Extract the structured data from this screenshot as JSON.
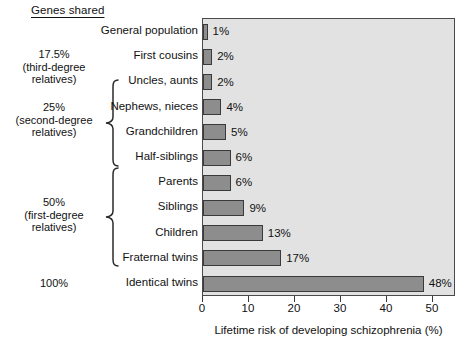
{
  "header": {
    "genes_shared_title": "Genes shared"
  },
  "group_labels": [
    {
      "text": "17.5%\n(third-degree\nrelatives)",
      "name": "group-label-17-5"
    },
    {
      "text": "25%\n(second-degree\nrelatives)",
      "name": "group-label-25"
    },
    {
      "text": "50%\n(first-degree\nrelatives)",
      "name": "group-label-50"
    },
    {
      "text": "100%",
      "name": "group-label-100"
    }
  ],
  "axis": {
    "x_title": "Lifetime risk of developing schizophrenia (%)",
    "ticks": [
      0,
      10,
      20,
      30,
      40,
      50
    ],
    "tick_labels": [
      "0",
      "10",
      "20",
      "30",
      "40",
      "50"
    ],
    "xlim": [
      0,
      55
    ]
  },
  "colors": {
    "bar_fill": "#8d8d8d",
    "bar_stroke": "#3a3a3a",
    "plot_background": "#e2e2e2",
    "plot_border": "#4a4a4a",
    "text": "#111111"
  },
  "chart_data": {
    "type": "bar",
    "orientation": "horizontal",
    "title": "",
    "xlabel": "Lifetime risk of developing schizophrenia (%)",
    "ylabel": "",
    "xlim": [
      0,
      55
    ],
    "grid": false,
    "legend": "none",
    "categories": [
      "General population",
      "First cousins",
      "Uncles, aunts",
      "Nephews, nieces",
      "Grandchildren",
      "Half-siblings",
      "Parents",
      "Siblings",
      "Children",
      "Fraternal twins",
      "Identical twins"
    ],
    "values": [
      1,
      2,
      2,
      4,
      5,
      6,
      6,
      9,
      13,
      17,
      48
    ],
    "value_labels": [
      "1%",
      "2%",
      "2%",
      "4%",
      "5%",
      "6%",
      "6%",
      "9%",
      "13%",
      "17%",
      "48%"
    ],
    "groups": [
      {
        "label": "17.5% (third-degree relatives)",
        "categories": [
          "First cousins"
        ],
        "bracket": false
      },
      {
        "label": "25% (second-degree relatives)",
        "categories": [
          "Uncles, aunts",
          "Nephews, nieces",
          "Grandchildren",
          "Half-siblings"
        ],
        "bracket": true
      },
      {
        "label": "50% (first-degree relatives)",
        "categories": [
          "Parents",
          "Siblings",
          "Children",
          "Fraternal twins"
        ],
        "bracket": true
      },
      {
        "label": "100%",
        "categories": [
          "Identical twins"
        ],
        "bracket": false
      }
    ]
  }
}
